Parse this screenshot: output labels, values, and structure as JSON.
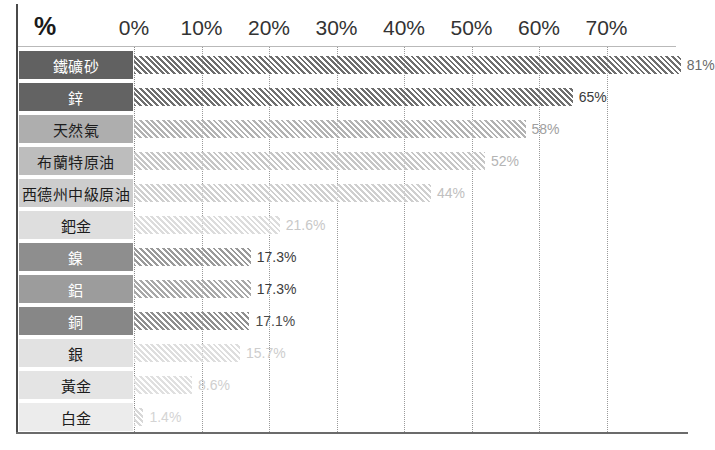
{
  "header": {
    "unit_symbol": "%"
  },
  "axis": {
    "ticks": [
      "0%",
      "10%",
      "20%",
      "30%",
      "40%",
      "50%",
      "60%",
      "70%"
    ],
    "tick_values": [
      0,
      10,
      20,
      30,
      40,
      50,
      60,
      70
    ]
  },
  "chart_data": {
    "type": "bar",
    "orientation": "horizontal",
    "title": "",
    "subtitle": "",
    "xlabel": "%",
    "ylabel": "",
    "xlim": [
      0,
      80
    ],
    "grid": true,
    "legend": "none",
    "categories": [
      "鐵礦砂",
      "鋅",
      "天然氣",
      "布蘭特原油",
      "西德州中級原油",
      "鈀金",
      "鎳",
      "鋁",
      "銅",
      "銀",
      "黃金",
      "白金"
    ],
    "values": [
      81,
      65,
      58,
      52,
      44,
      21.6,
      17.3,
      17.3,
      17.1,
      15.7,
      8.6,
      1.4
    ],
    "data_labels": [
      "81%",
      "65%",
      "58%",
      "52%",
      "44%",
      "21.6%",
      "17.3%",
      "17.3%",
      "17.1%",
      "15.7%",
      "8.6%",
      "1.4%"
    ],
    "bar_colors": [
      "#6e6e6e",
      "#6f6f6f",
      "#b2b2b2",
      "#c6c6c6",
      "#cfcfcf",
      "#dcdcdc",
      "#9a9a9a",
      "#a8a8a8",
      "#8f8f8f",
      "#dedede",
      "#e0e0e0",
      "#d8d8d8"
    ],
    "label_cell_colors": [
      "#616161",
      "#636363",
      "#aeaeae",
      "#bdbdbd",
      "#cdcdcd",
      "#dedede",
      "#8e8e8e",
      "#9c9c9c",
      "#878787",
      "#e2e2e2",
      "#e4e4e4",
      "#ececec"
    ],
    "label_text_colors": [
      "#ffffff",
      "#ffffff",
      "#1c1c1c",
      "#1c1c1c",
      "#1c1c1c",
      "#1c1c1c",
      "#ffffff",
      "#ffffff",
      "#ffffff",
      "#1c1c1c",
      "#1c1c1c",
      "#1c1c1c"
    ],
    "value_text_colors": [
      "#6a6a6a",
      "#3a3a3a",
      "#a0a0a0",
      "#b4b4b4",
      "#c0c0c0",
      "#c8c8c8",
      "#3c3c3c",
      "#3c3c3c",
      "#4a4a4a",
      "#cdcdcd",
      "#cfcfcf",
      "#d4d4d4"
    ]
  },
  "colors": {
    "frame": "#4a4a4a",
    "gridline": "#9a9a9a",
    "background": "#ffffff",
    "tick_text": "#333333"
  }
}
